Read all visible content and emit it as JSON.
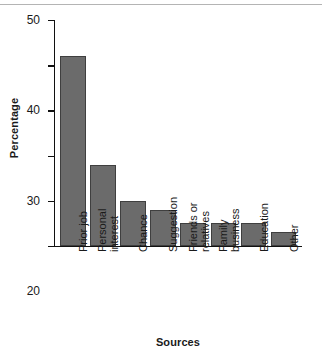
{
  "chart_data": {
    "type": "bar",
    "title": "",
    "xlabel": "Sources",
    "ylabel": "Percentage",
    "categories": [
      "Prior job",
      "Personal interest",
      "Chance",
      "Suggestion",
      "Friends or relatives",
      "Family business",
      "Education",
      "Other"
    ],
    "category_lines": [
      [
        "Prior job"
      ],
      [
        "Personal",
        "interest"
      ],
      [
        "Chance"
      ],
      [
        "Suggestion"
      ],
      [
        "Friends or",
        "relatives"
      ],
      [
        "Family",
        "business"
      ],
      [
        "Education"
      ],
      [
        "Other"
      ]
    ],
    "values": [
      42,
      18,
      10,
      8,
      5,
      5,
      5,
      3
    ],
    "ylim": [
      0,
      50
    ],
    "yticks": [
      0,
      10,
      20,
      30,
      40,
      50
    ],
    "ytick_labels": [
      "0",
      "10",
      "20",
      "30",
      "40",
      "50"
    ],
    "grid": false,
    "legend": null,
    "bar_color": "#6b6b6b",
    "bar_edge_color": "#3f3f3f",
    "axis_color": "#111111",
    "text_color": "#1a1a1a",
    "background": "#ffffff"
  }
}
